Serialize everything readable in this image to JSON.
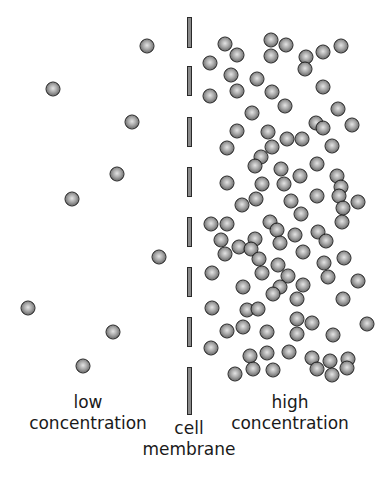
{
  "diagram": {
    "labels": {
      "low": {
        "line1": "low",
        "line2": "concentration"
      },
      "high": {
        "line1": "high",
        "line2": "concentration"
      },
      "membrane": {
        "line1": "cell",
        "line2": "membrane"
      }
    },
    "colors": {
      "molecule_fill": "#a9a9a9",
      "molecule_outline": "#1e1e1e",
      "membrane_fill": "#8a8a8a",
      "background": "#ffffff"
    },
    "membrane": {
      "x": 187,
      "dashes": [
        [
          17,
          48
        ],
        [
          66,
          96
        ],
        [
          117,
          147
        ],
        [
          167,
          197
        ],
        [
          217,
          247
        ],
        [
          267,
          297
        ],
        [
          317,
          347
        ],
        [
          367,
          415
        ]
      ]
    },
    "low_side_molecules": [
      [
        147,
        46
      ],
      [
        53,
        89
      ],
      [
        132,
        122
      ],
      [
        117,
        174
      ],
      [
        72,
        199
      ],
      [
        159,
        257
      ],
      [
        28,
        308
      ],
      [
        113,
        332
      ],
      [
        83,
        366
      ]
    ],
    "high_side_molecules": [
      [
        225,
        44
      ],
      [
        237,
        55
      ],
      [
        210,
        63
      ],
      [
        271,
        40
      ],
      [
        271,
        56
      ],
      [
        286,
        45
      ],
      [
        306,
        57
      ],
      [
        305,
        69
      ],
      [
        323,
        52
      ],
      [
        341,
        46
      ],
      [
        231,
        75
      ],
      [
        237,
        91
      ],
      [
        210,
        96
      ],
      [
        257,
        79
      ],
      [
        272,
        92
      ],
      [
        285,
        106
      ],
      [
        323,
        87
      ],
      [
        252,
        113
      ],
      [
        338,
        109
      ],
      [
        316,
        123
      ],
      [
        323,
        128
      ],
      [
        352,
        125
      ],
      [
        237,
        131
      ],
      [
        268,
        132
      ],
      [
        287,
        139
      ],
      [
        302,
        139
      ],
      [
        332,
        146
      ],
      [
        227,
        148
      ],
      [
        272,
        147
      ],
      [
        261,
        157
      ],
      [
        255,
        166
      ],
      [
        317,
        164
      ],
      [
        281,
        169
      ],
      [
        300,
        176
      ],
      [
        337,
        176
      ],
      [
        227,
        183
      ],
      [
        262,
        184
      ],
      [
        284,
        184
      ],
      [
        341,
        187
      ],
      [
        339,
        196
      ],
      [
        317,
        196
      ],
      [
        291,
        201
      ],
      [
        256,
        199
      ],
      [
        242,
        205
      ],
      [
        358,
        202
      ],
      [
        343,
        208
      ],
      [
        301,
        214
      ],
      [
        342,
        222
      ],
      [
        211,
        224
      ],
      [
        227,
        224
      ],
      [
        270,
        222
      ],
      [
        277,
        230
      ],
      [
        295,
        235
      ],
      [
        318,
        232
      ],
      [
        326,
        241
      ],
      [
        221,
        240
      ],
      [
        255,
        239
      ],
      [
        239,
        247
      ],
      [
        251,
        249
      ],
      [
        280,
        243
      ],
      [
        303,
        252
      ],
      [
        225,
        254
      ],
      [
        259,
        259
      ],
      [
        278,
        265
      ],
      [
        324,
        263
      ],
      [
        344,
        258
      ],
      [
        212,
        273
      ],
      [
        262,
        273
      ],
      [
        288,
        276
      ],
      [
        328,
        277
      ],
      [
        358,
        281
      ],
      [
        243,
        287
      ],
      [
        280,
        287
      ],
      [
        303,
        285
      ],
      [
        273,
        294
      ],
      [
        297,
        299
      ],
      [
        343,
        299
      ],
      [
        212,
        308
      ],
      [
        247,
        310
      ],
      [
        258,
        309
      ],
      [
        297,
        319
      ],
      [
        312,
        323
      ],
      [
        367,
        324
      ],
      [
        227,
        331
      ],
      [
        243,
        327
      ],
      [
        267,
        332
      ],
      [
        297,
        334
      ],
      [
        333,
        335
      ],
      [
        211,
        348
      ],
      [
        250,
        356
      ],
      [
        267,
        353
      ],
      [
        289,
        352
      ],
      [
        312,
        358
      ],
      [
        330,
        361
      ],
      [
        348,
        359
      ],
      [
        253,
        369
      ],
      [
        235,
        374
      ],
      [
        273,
        370
      ],
      [
        317,
        369
      ],
      [
        332,
        375
      ],
      [
        347,
        368
      ]
    ]
  }
}
